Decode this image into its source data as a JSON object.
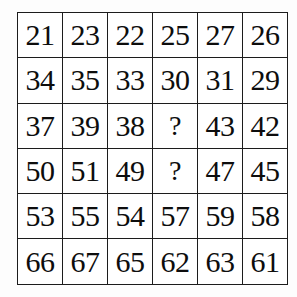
{
  "puzzle": {
    "type": "number-grid",
    "rows": 6,
    "columns": 6,
    "unknown_marker": "?",
    "colors": {
      "background": "#fdfdfd",
      "cell_background": "#ffffff",
      "grid_line": "#1c1c1c",
      "text": "#0d0d0d"
    },
    "cells": [
      [
        "21",
        "23",
        "22",
        "25",
        "27",
        "26"
      ],
      [
        "34",
        "35",
        "33",
        "30",
        "31",
        "29"
      ],
      [
        "37",
        "39",
        "38",
        "?",
        "43",
        "42"
      ],
      [
        "50",
        "51",
        "49",
        "?",
        "47",
        "45"
      ],
      [
        "53",
        "55",
        "54",
        "57",
        "59",
        "58"
      ],
      [
        "66",
        "67",
        "65",
        "62",
        "63",
        "61"
      ]
    ]
  }
}
